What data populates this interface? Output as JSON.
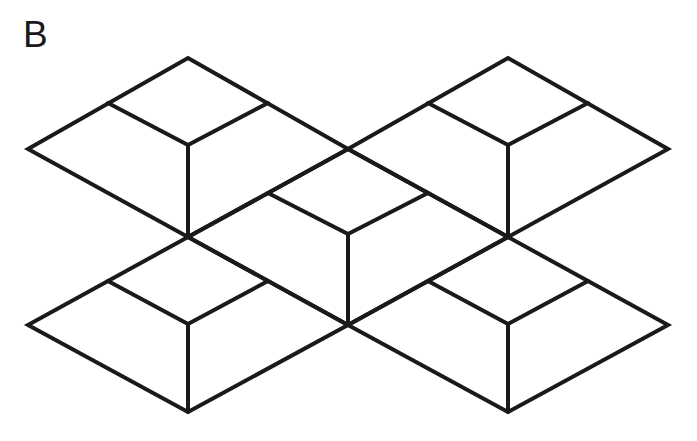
{
  "figure": {
    "panel_label": "B",
    "label_color": "#1a1a1a",
    "background_color": "#ffffff",
    "stroke_color": "#1a1a1a",
    "stroke_width": 4,
    "canvas": {
      "width": 697,
      "height": 441
    },
    "type": "line-diagram"
  },
  "chart_data": {
    "type": "diagram",
    "title": "B",
    "geometry": {
      "lattice": {
        "origin_x": 348,
        "origin_y": 237,
        "half_width": 160,
        "quarter_width": 80,
        "rise": 88,
        "half_rise": 44
      },
      "vertices": {
        "left_outer": [
          28,
          149
        ],
        "right_outer": [
          668,
          149
        ],
        "left_outer_low": [
          28,
          325
        ],
        "right_outer_low": [
          668,
          325
        ],
        "tl_apex": [
          188,
          58
        ],
        "tr_apex": [
          508,
          58
        ],
        "bl_apex": [
          188,
          412
        ],
        "br_apex": [
          508,
          412
        ],
        "node_left": [
          188,
          237
        ],
        "node_right": [
          508,
          237
        ],
        "node_top": [
          348,
          149
        ],
        "node_bottom": [
          348,
          325
        ],
        "mid_left_upper": [
          268,
          193
        ],
        "mid_right_upper": [
          428,
          193
        ],
        "inner_tl": [
          188,
          145
        ],
        "inner_tr": [
          508,
          145
        ],
        "inner_bl": [
          188,
          324
        ],
        "inner_br": [
          508,
          324
        ],
        "inner_mid": [
          348,
          234
        ]
      },
      "cubes": [
        {
          "name": "top-left-cube",
          "center": [
            188,
            149
          ]
        },
        {
          "name": "top-right-cube",
          "center": [
            508,
            149
          ]
        },
        {
          "name": "center-cube",
          "center": [
            348,
            237
          ]
        },
        {
          "name": "bottom-left-cube",
          "center": [
            188,
            325
          ]
        },
        {
          "name": "bottom-right-cube",
          "center": [
            508,
            325
          ]
        }
      ]
    },
    "paths": {
      "top_left_hex": "M 28 149 L 188 58 L 348 149 L 188 237 Z",
      "top_right_hex": "M 348 149 L 508 58 L 668 149 L 508 237 Z",
      "bottom_left_hex": "M 28 325 L 188 237 L 348 325 L 188 412 Z",
      "bottom_right_hex": "M 348 325 L 508 237 L 668 325 L 508 412 Z",
      "center_hex": "M 188 237 L 348 149 L 508 237 L 348 325 Z",
      "inner_tl_y": "M 108 103 L 188 145 L 268 103 M 188 145 L 188 237",
      "inner_tr_y": "M 428 103 L 508 145 L 588 103 M 508 145 L 508 237",
      "inner_bl_y": "M 108 281 L 188 324 L 268 281 M 188 324 L 188 412",
      "inner_br_y": "M 428 281 L 508 324 L 588 281 M 508 324 L 508 412",
      "inner_center_y": "M 268 193 L 348 234 L 428 193 M 348 234 L 348 325"
    }
  }
}
